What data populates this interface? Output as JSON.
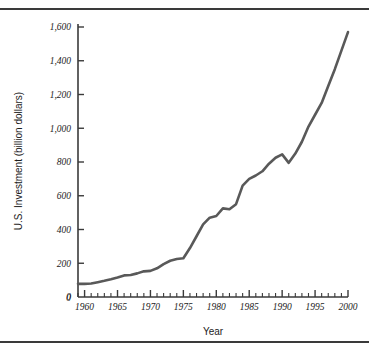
{
  "figure": {
    "background_color": "#ffffff",
    "rule_color": "#3a3a3a",
    "line_color": "#595959",
    "axis_color": "#3a3a3a",
    "text_color": "#1c1c1c"
  },
  "chart_data": {
    "type": "line",
    "title": "",
    "xlabel": "Year",
    "ylabel": "U.S. Investment (billion dollars)",
    "xlim": [
      1959,
      2000
    ],
    "ylim": [
      0,
      1600
    ],
    "grid": false,
    "legend": "none",
    "y_ticks": [
      0,
      200,
      400,
      600,
      800,
      1000,
      1200,
      1400,
      1600
    ],
    "y_tick_labels": [
      "0",
      "200",
      "400",
      "600",
      "800",
      "1,000",
      "1,200",
      "1,400",
      "1,600"
    ],
    "x_ticks": [
      1960,
      1965,
      1970,
      1975,
      1980,
      1985,
      1990,
      1995,
      2000
    ],
    "x_tick_labels": [
      "1960",
      "1965",
      "1970",
      "1975",
      "1980",
      "1985",
      "1990",
      "1995",
      "2000"
    ],
    "x_minor_tick_interval": 1,
    "x": [
      1959,
      1960,
      1961,
      1962,
      1963,
      1964,
      1965,
      1966,
      1967,
      1968,
      1969,
      1970,
      1971,
      1972,
      1973,
      1974,
      1975,
      1976,
      1977,
      1978,
      1979,
      1980,
      1981,
      1982,
      1983,
      1984,
      1985,
      1986,
      1987,
      1988,
      1989,
      1990,
      1991,
      1992,
      1993,
      1994,
      1995,
      1996,
      1997,
      1998,
      1999,
      2000
    ],
    "values": [
      78,
      78,
      80,
      88,
      96,
      105,
      116,
      128,
      130,
      140,
      152,
      155,
      170,
      195,
      215,
      225,
      230,
      290,
      360,
      430,
      470,
      480,
      525,
      520,
      550,
      660,
      700,
      720,
      745,
      790,
      825,
      845,
      795,
      850,
      920,
      1010,
      1080,
      1150,
      1250,
      1350,
      1460,
      1570
    ],
    "series_name": "U.S. Investment"
  }
}
